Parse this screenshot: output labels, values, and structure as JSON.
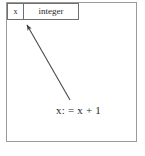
{
  "diagram": {
    "frame": {
      "border_color": "#9a9a9a",
      "background_color": "#ffffff"
    },
    "variable_box": {
      "name": "x",
      "type": "integer",
      "border_color": "#6f6f6f"
    },
    "statement": {
      "text": "x: = x + 1"
    },
    "arrow": {
      "icon": "arrow-up-left-icon",
      "color": "#4a4a4a",
      "from_x": 70,
      "from_y": 100,
      "to_x": 26,
      "to_y": 24,
      "head": "solid"
    }
  }
}
